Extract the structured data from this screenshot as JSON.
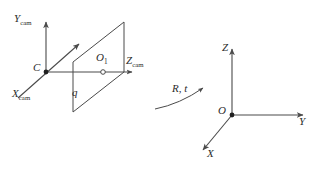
{
  "figure": {
    "background_color": "#ffffff",
    "stroke_color": "#4a4a4a",
    "text_color": "#2b2b2b",
    "width": 316,
    "height": 173
  },
  "camera_frame": {
    "origin_label": "C",
    "axes": [
      {
        "name": "y-cam-axis",
        "base": "Y",
        "sub": "cam",
        "direction": "up"
      },
      {
        "name": "x-cam-axis",
        "base": "X",
        "sub": "cam",
        "direction": "down-left"
      },
      {
        "name": "z-cam-axis",
        "base": "Z",
        "sub": "cam",
        "direction": "right"
      }
    ],
    "image_plane": {
      "name": "image-plane",
      "principal_point_label": "O",
      "principal_point_sub": "1",
      "image_point_label": "q"
    }
  },
  "world_frame": {
    "origin_label": "O",
    "axes": [
      {
        "name": "z-world-axis",
        "base": "Z",
        "direction": "up"
      },
      {
        "name": "y-world-axis",
        "base": "Y",
        "direction": "right"
      },
      {
        "name": "x-world-axis",
        "base": "X",
        "direction": "down-left"
      }
    ]
  },
  "transform": {
    "name": "rigid-transform",
    "label_r": "R",
    "separator": ",",
    "label_t": "t"
  }
}
